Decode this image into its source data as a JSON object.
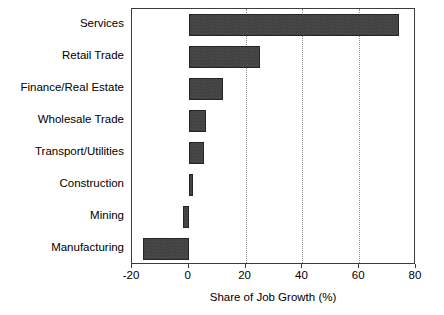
{
  "chart_data": {
    "type": "bar",
    "orientation": "horizontal",
    "title": "",
    "xlabel": "Share of Job Growth (%)",
    "ylabel": "",
    "categories": [
      "Services",
      "Retail Trade",
      "Finance/Real Estate",
      "Wholesale Trade",
      "Transport/Utilities",
      "Construction",
      "Mining",
      "Manufacturing"
    ],
    "values": [
      74,
      25,
      12,
      6,
      5.5,
      1.5,
      -2,
      -16
    ],
    "xlim": [
      -20,
      80
    ],
    "xticks": [
      -20,
      0,
      20,
      40,
      60,
      80
    ],
    "xticklabels": [
      "-20",
      "0",
      "20",
      "40",
      "60",
      "80"
    ],
    "gridlines": [
      20,
      40,
      60
    ],
    "grid": true,
    "legend": null,
    "bar_color": "#3c3c3c",
    "bar_edge_color": "#252525",
    "background": "#ffffff",
    "axis_color": "#3c3c3c"
  }
}
